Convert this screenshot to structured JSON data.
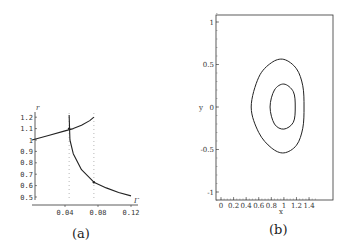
{
  "chart_data": [
    {
      "type": "line",
      "panel_label": "(a)",
      "title": "",
      "xlabel": "Γ",
      "ylabel": "r",
      "x_ticks": [
        "0.04",
        "0.08",
        "0.12"
      ],
      "y_ticks": [
        "0.5",
        "0.6",
        "0.7",
        "0.8",
        "0.9",
        "1",
        "1.1",
        "1.2"
      ],
      "xlim": [
        0,
        0.12
      ],
      "ylim": [
        0.5,
        1.2
      ],
      "grid": false,
      "series": [
        {
          "name": "upper branch",
          "x": [
            0.0,
            0.02,
            0.04,
            0.05,
            0.06,
            0.07,
            0.075
          ],
          "y": [
            1.0,
            1.04,
            1.08,
            1.1,
            1.13,
            1.17,
            1.2
          ]
        },
        {
          "name": "lower branch",
          "x": [
            0.045,
            0.046,
            0.05,
            0.06,
            0.075,
            0.09,
            0.105,
            0.12
          ],
          "y": [
            1.22,
            1.0,
            0.88,
            0.74,
            0.63,
            0.58,
            0.54,
            0.51
          ]
        }
      ],
      "annotations": [
        {
          "type": "vertical-dotted-line",
          "x": 0.045
        },
        {
          "type": "vertical-dotted-line",
          "x": 0.075
        },
        {
          "type": "point",
          "x": 0.045,
          "y": 1.1
        },
        {
          "type": "point",
          "x": 0.075,
          "y": 0.63
        }
      ]
    },
    {
      "type": "line",
      "panel_label": "(b)",
      "title": "",
      "xlabel": "x",
      "ylabel": "y",
      "x_ticks": [
        "0",
        "0.2",
        "0.4",
        "0.6",
        "0.8",
        "1",
        "1.2",
        "1.4"
      ],
      "y_ticks": [
        "-1",
        "-0.5",
        "0",
        "0.5",
        "1"
      ],
      "xlim": [
        -0.05,
        1.55
      ],
      "ylim": [
        -1.1,
        1.1
      ],
      "grid": false,
      "series": [
        {
          "name": "outer orbit",
          "closed": true,
          "x": [
            0.48,
            0.6,
            0.8,
            1.0,
            1.2,
            1.3,
            1.32,
            1.3,
            1.2,
            1.0,
            0.8,
            0.6,
            0.48
          ],
          "y": [
            0.0,
            0.35,
            0.52,
            0.56,
            0.45,
            0.25,
            0.0,
            -0.25,
            -0.45,
            -0.54,
            -0.48,
            -0.3,
            0.0
          ]
        },
        {
          "name": "inner orbit",
          "closed": true,
          "x": [
            0.78,
            0.85,
            1.0,
            1.15,
            1.18,
            1.15,
            1.0,
            0.85,
            0.78
          ],
          "y": [
            0.0,
            0.2,
            0.27,
            0.18,
            0.0,
            -0.18,
            -0.26,
            -0.2,
            0.0
          ]
        }
      ]
    }
  ]
}
